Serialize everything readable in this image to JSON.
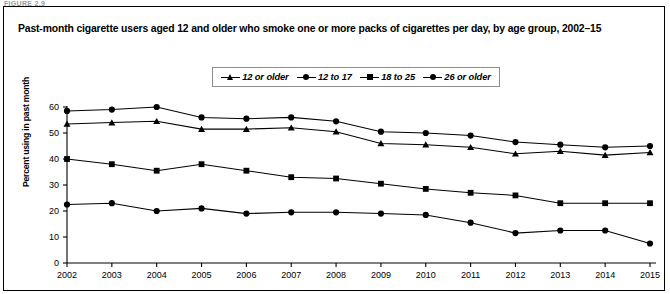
{
  "figure_caption_partial": "FIGURE 2.9",
  "chart_title": "Past-month cigarette users aged 12 and older who smoke one or more packs of cigarettes per day, by age group, 2002–15",
  "ylabel": "Percent using in past month",
  "legend": {
    "items": [
      {
        "label": "12 or older",
        "marker": "triangle"
      },
      {
        "label": "12 to 17",
        "marker": "circle"
      },
      {
        "label": "18 to 25",
        "marker": "square"
      },
      {
        "label": "26 or older",
        "marker": "circle"
      }
    ]
  },
  "chart_data": {
    "type": "line",
    "title": "Past-month cigarette users aged 12 and older who smoke one or more packs of cigarettes per day, by age group, 2002–15",
    "xlabel": "",
    "ylabel": "Percent using in past month",
    "x": [
      2002,
      2003,
      2004,
      2005,
      2006,
      2007,
      2008,
      2009,
      2010,
      2011,
      2012,
      2013,
      2014,
      2015
    ],
    "categories": [
      "2002",
      "2003",
      "2004",
      "2005",
      "2006",
      "2007",
      "2008",
      "2009",
      "2010",
      "2011",
      "2012",
      "2013",
      "2014",
      "2015"
    ],
    "ylim": [
      0,
      60
    ],
    "yticks": [
      0,
      10,
      20,
      30,
      40,
      50,
      60
    ],
    "xlim": [
      2002,
      2015
    ],
    "grid": false,
    "legend_position": "top-center",
    "series": [
      {
        "name": "12 or older",
        "marker": "triangle",
        "values": [
          53.5,
          54.0,
          54.5,
          51.5,
          51.5,
          52.0,
          50.5,
          46.0,
          45.5,
          44.5,
          42.0,
          43.0,
          41.5,
          42.5
        ]
      },
      {
        "name": "12 to 17",
        "marker": "circle",
        "values": [
          22.5,
          23.0,
          20.0,
          21.0,
          19.0,
          19.5,
          19.5,
          19.0,
          18.5,
          15.5,
          11.5,
          12.5,
          12.5,
          7.5
        ]
      },
      {
        "name": "18 to 25",
        "marker": "square",
        "values": [
          40.0,
          38.0,
          35.5,
          38.0,
          35.5,
          33.0,
          32.5,
          30.5,
          28.5,
          27.0,
          26.0,
          23.0,
          23.0,
          23.0
        ]
      },
      {
        "name": "26 or older",
        "marker": "circle",
        "values": [
          58.5,
          59.0,
          60.0,
          56.0,
          55.5,
          56.0,
          54.5,
          50.5,
          50.0,
          49.0,
          46.5,
          45.5,
          44.5,
          45.0
        ]
      }
    ]
  }
}
